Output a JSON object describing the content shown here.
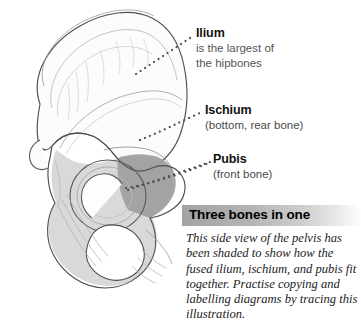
{
  "illustration": {
    "name": "pelvis-side-view",
    "shading": {
      "ilium_fill": "#fdfdfd",
      "ischium_fill": "#d0d0d0",
      "pubis_fill": "#9f9f9f",
      "outline": "#5a5a5a",
      "detail_line": "#b3b3b3"
    }
  },
  "callouts": [
    {
      "id": "ilium",
      "title": "Ilium",
      "sub_line_1": "is the largest of",
      "sub_line_2": "the hipbones"
    },
    {
      "id": "ischium",
      "title": "Ischium",
      "sub_line_1": "(bottom, rear bone)"
    },
    {
      "id": "pubis",
      "title": "Pubis",
      "sub_line_1": "(front bone)"
    }
  ],
  "info_box": {
    "title": "Three bones in one",
    "body": "This side view of the pelvis has been shaded to show how the fused ilium, ischium, and pubis fit together. Practise copying and labelling diagrams by tracing this illustration.",
    "header_gradient_start": "#a3a3a3",
    "header_gradient_end": "#ffffff"
  },
  "leader_lines": {
    "style": "dotted",
    "color": "#555555"
  }
}
